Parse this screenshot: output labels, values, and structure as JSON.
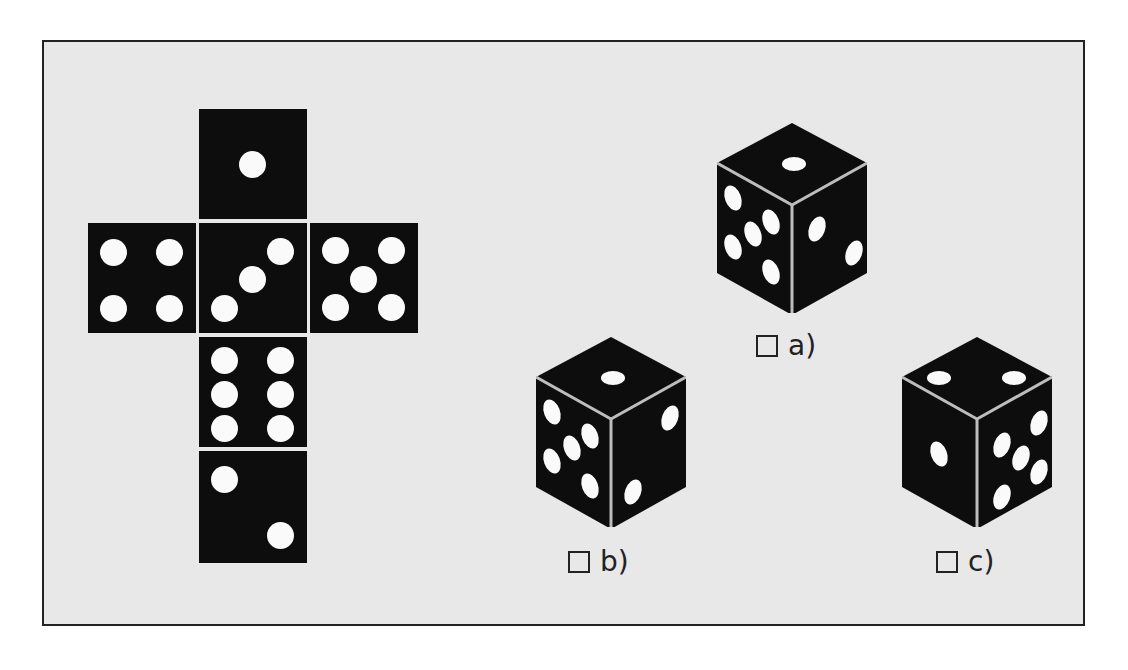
{
  "puzzle": {
    "type": "cube-net-folding",
    "net": {
      "layout": "cross",
      "faces": [
        {
          "position": "top",
          "pips": 1
        },
        {
          "position": "left",
          "pips": 4
        },
        {
          "position": "center",
          "pips": 3
        },
        {
          "position": "right",
          "pips": 5
        },
        {
          "position": "below-center",
          "pips": 6
        },
        {
          "position": "bottom",
          "pips": 2
        }
      ]
    },
    "options": [
      {
        "id": "a",
        "label": "a)",
        "checked": false,
        "top_face": 1,
        "left_face": 5,
        "right_face": 2
      },
      {
        "id": "b",
        "label": "b)",
        "checked": false,
        "top_face": 1,
        "left_face": 5,
        "right_face": 2
      },
      {
        "id": "c",
        "label": "c)",
        "checked": false,
        "top_face": 2,
        "left_face": 1,
        "right_face": 5
      }
    ]
  },
  "colors": {
    "background": "#e8e8e8",
    "frame_border": "#222222",
    "die_face": "#0d0d0d",
    "pip": "#fafafa",
    "edge": "#bdbdbd"
  }
}
